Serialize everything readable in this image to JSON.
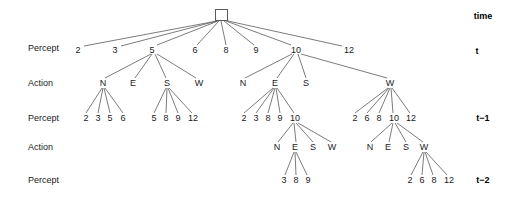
{
  "figure": {
    "background": "#ffffff",
    "line_color": "#5a5a5a",
    "text_color": "#1a1a1a"
  },
  "row_labels": [
    {
      "id": "row-percept-t",
      "text": "Percept",
      "x": 28,
      "y": 48
    },
    {
      "id": "row-action-t",
      "text": "Action",
      "x": 28,
      "y": 83
    },
    {
      "id": "row-percept-t1",
      "text": "Percept",
      "x": 28,
      "y": 118
    },
    {
      "id": "row-action-t1",
      "text": "Action",
      "x": 28,
      "y": 147
    },
    {
      "id": "row-percept-t2",
      "text": "Percept",
      "x": 28,
      "y": 180
    }
  ],
  "time_labels": [
    {
      "id": "time-header",
      "text": "time",
      "x": 483,
      "y": 16
    },
    {
      "id": "time-t",
      "text": "t",
      "x": 477,
      "y": 51
    },
    {
      "id": "time-t-minus-1",
      "text": "t−1",
      "x": 483,
      "y": 118
    },
    {
      "id": "time-t-minus-2",
      "text": "t−2",
      "x": 483,
      "y": 180
    }
  ],
  "root": {
    "id": "root-node",
    "x": 215,
    "y": 9,
    "w": 13,
    "h": 12
  },
  "nodes": [
    {
      "id": "p-t-2",
      "text": "2",
      "x": 78,
      "y": 50,
      "level": "percept-t"
    },
    {
      "id": "p-t-3",
      "text": "3",
      "x": 115,
      "y": 50,
      "level": "percept-t"
    },
    {
      "id": "p-t-5",
      "text": "5",
      "x": 152,
      "y": 50,
      "level": "percept-t"
    },
    {
      "id": "p-t-6",
      "text": "6",
      "x": 195,
      "y": 50,
      "level": "percept-t"
    },
    {
      "id": "p-t-8",
      "text": "8",
      "x": 226,
      "y": 50,
      "level": "percept-t"
    },
    {
      "id": "p-t-9",
      "text": "9",
      "x": 256,
      "y": 50,
      "level": "percept-t"
    },
    {
      "id": "p-t-10",
      "text": "10",
      "x": 296,
      "y": 50,
      "level": "percept-t"
    },
    {
      "id": "p-t-12",
      "text": "12",
      "x": 349,
      "y": 50,
      "level": "percept-t"
    },
    {
      "id": "a-t-5-N",
      "text": "N",
      "x": 103,
      "y": 83,
      "level": "action-t"
    },
    {
      "id": "a-t-5-E",
      "text": "E",
      "x": 133,
      "y": 83,
      "level": "action-t"
    },
    {
      "id": "a-t-5-S",
      "text": "S",
      "x": 167,
      "y": 83,
      "level": "action-t"
    },
    {
      "id": "a-t-5-W",
      "text": "W",
      "x": 199,
      "y": 83,
      "level": "action-t"
    },
    {
      "id": "a-t-10-N",
      "text": "N",
      "x": 243,
      "y": 83,
      "level": "action-t"
    },
    {
      "id": "a-t-10-E",
      "text": "E",
      "x": 275,
      "y": 83,
      "level": "action-t"
    },
    {
      "id": "a-t-10-S",
      "text": "S",
      "x": 306,
      "y": 83,
      "level": "action-t"
    },
    {
      "id": "a-t-12-W",
      "text": "W",
      "x": 390,
      "y": 83,
      "level": "action-t"
    },
    {
      "id": "p-t1-g1-2",
      "text": "2",
      "x": 86,
      "y": 118,
      "level": "percept-t1"
    },
    {
      "id": "p-t1-g1-3",
      "text": "3",
      "x": 98,
      "y": 118,
      "level": "percept-t1"
    },
    {
      "id": "p-t1-g1-5",
      "text": "5",
      "x": 110,
      "y": 118,
      "level": "percept-t1"
    },
    {
      "id": "p-t1-g1-6",
      "text": "6",
      "x": 123,
      "y": 118,
      "level": "percept-t1"
    },
    {
      "id": "p-t1-g2-5",
      "text": "5",
      "x": 154,
      "y": 118,
      "level": "percept-t1"
    },
    {
      "id": "p-t1-g2-8",
      "text": "8",
      "x": 166,
      "y": 118,
      "level": "percept-t1"
    },
    {
      "id": "p-t1-g2-9",
      "text": "9",
      "x": 178,
      "y": 118,
      "level": "percept-t1"
    },
    {
      "id": "p-t1-g2-12",
      "text": "12",
      "x": 193,
      "y": 118,
      "level": "percept-t1"
    },
    {
      "id": "p-t1-g3-2",
      "text": "2",
      "x": 244,
      "y": 118,
      "level": "percept-t1"
    },
    {
      "id": "p-t1-g3-3",
      "text": "3",
      "x": 256,
      "y": 118,
      "level": "percept-t1"
    },
    {
      "id": "p-t1-g3-8",
      "text": "8",
      "x": 268,
      "y": 118,
      "level": "percept-t1"
    },
    {
      "id": "p-t1-g3-9",
      "text": "9",
      "x": 280,
      "y": 118,
      "level": "percept-t1"
    },
    {
      "id": "p-t1-g3-10",
      "text": "10",
      "x": 295,
      "y": 118,
      "level": "percept-t1"
    },
    {
      "id": "p-t1-g4-2",
      "text": "2",
      "x": 355,
      "y": 118,
      "level": "percept-t1"
    },
    {
      "id": "p-t1-g4-6",
      "text": "6",
      "x": 367,
      "y": 118,
      "level": "percept-t1"
    },
    {
      "id": "p-t1-g4-8",
      "text": "8",
      "x": 379,
      "y": 118,
      "level": "percept-t1"
    },
    {
      "id": "p-t1-g4-10",
      "text": "10",
      "x": 394,
      "y": 118,
      "level": "percept-t1"
    },
    {
      "id": "p-t1-g4-12",
      "text": "12",
      "x": 411,
      "y": 118,
      "level": "percept-t1"
    },
    {
      "id": "a-t1-g1-N",
      "text": "N",
      "x": 277,
      "y": 147,
      "level": "action-t1"
    },
    {
      "id": "a-t1-g1-E",
      "text": "E",
      "x": 295,
      "y": 147,
      "level": "action-t1"
    },
    {
      "id": "a-t1-g1-S",
      "text": "S",
      "x": 313,
      "y": 147,
      "level": "action-t1"
    },
    {
      "id": "a-t1-g1-W",
      "text": "W",
      "x": 332,
      "y": 147,
      "level": "action-t1"
    },
    {
      "id": "a-t1-g2-N",
      "text": "N",
      "x": 370,
      "y": 147,
      "level": "action-t1"
    },
    {
      "id": "a-t1-g2-E",
      "text": "E",
      "x": 388,
      "y": 147,
      "level": "action-t1"
    },
    {
      "id": "a-t1-g2-S",
      "text": "S",
      "x": 406,
      "y": 147,
      "level": "action-t1"
    },
    {
      "id": "a-t1-g2-W",
      "text": "W",
      "x": 424,
      "y": 147,
      "level": "action-t1"
    },
    {
      "id": "p-t2-g1-3",
      "text": "3",
      "x": 284,
      "y": 180,
      "level": "percept-t2"
    },
    {
      "id": "p-t2-g1-8",
      "text": "8",
      "x": 296,
      "y": 180,
      "level": "percept-t2"
    },
    {
      "id": "p-t2-g1-9",
      "text": "9",
      "x": 308,
      "y": 180,
      "level": "percept-t2"
    },
    {
      "id": "p-t2-g2-2",
      "text": "2",
      "x": 410,
      "y": 180,
      "level": "percept-t2"
    },
    {
      "id": "p-t2-g2-6",
      "text": "6",
      "x": 422,
      "y": 180,
      "level": "percept-t2"
    },
    {
      "id": "p-t2-g2-8",
      "text": "8",
      "x": 434,
      "y": 180,
      "level": "percept-t2"
    },
    {
      "id": "p-t2-g2-12",
      "text": "12",
      "x": 449,
      "y": 180,
      "level": "percept-t2"
    }
  ],
  "edges": [
    {
      "from": "root-node",
      "to": "p-t-2",
      "x1": 217,
      "y1": 21,
      "x2": 84,
      "y2": 46
    },
    {
      "from": "root-node",
      "to": "p-t-3",
      "x1": 217,
      "y1": 21,
      "x2": 121,
      "y2": 46
    },
    {
      "from": "root-node",
      "to": "p-t-5",
      "x1": 218,
      "y1": 21,
      "x2": 157,
      "y2": 45
    },
    {
      "from": "root-node",
      "to": "p-t-6",
      "x1": 219,
      "y1": 21,
      "x2": 197,
      "y2": 45
    },
    {
      "from": "root-node",
      "to": "p-t-8",
      "x1": 221,
      "y1": 21,
      "x2": 226,
      "y2": 45
    },
    {
      "from": "root-node",
      "to": "p-t-9",
      "x1": 224,
      "y1": 21,
      "x2": 254,
      "y2": 45
    },
    {
      "from": "root-node",
      "to": "p-t-10",
      "x1": 226,
      "y1": 21,
      "x2": 291,
      "y2": 45
    },
    {
      "from": "root-node",
      "to": "p-t-12",
      "x1": 228,
      "y1": 21,
      "x2": 342,
      "y2": 46
    },
    {
      "from": "p-t-5",
      "to": "a-t-5-N",
      "x1": 151,
      "y1": 54,
      "x2": 105,
      "y2": 78
    },
    {
      "from": "p-t-5",
      "to": "a-t-5-E",
      "x1": 152,
      "y1": 54,
      "x2": 135,
      "y2": 78
    },
    {
      "from": "p-t-5",
      "to": "a-t-5-S",
      "x1": 155,
      "y1": 54,
      "x2": 166,
      "y2": 78
    },
    {
      "from": "p-t-5",
      "to": "a-t-5-W",
      "x1": 157,
      "y1": 54,
      "x2": 196,
      "y2": 78
    },
    {
      "from": "p-t-10",
      "to": "a-t-10-N",
      "x1": 292,
      "y1": 54,
      "x2": 245,
      "y2": 78
    },
    {
      "from": "p-t-10",
      "to": "a-t-10-E",
      "x1": 294,
      "y1": 54,
      "x2": 277,
      "y2": 78
    },
    {
      "from": "p-t-10",
      "to": "a-t-10-S",
      "x1": 298,
      "y1": 54,
      "x2": 306,
      "y2": 78
    },
    {
      "from": "p-t-10",
      "to": "a-t-12-W",
      "x1": 301,
      "y1": 54,
      "x2": 387,
      "y2": 78
    },
    {
      "from": "a-t-5-N",
      "to": "p-t1-g1-2",
      "x1": 102,
      "y1": 88,
      "x2": 86,
      "y2": 113
    },
    {
      "from": "a-t-5-N",
      "to": "p-t1-g1-3",
      "x1": 103,
      "y1": 88,
      "x2": 98,
      "y2": 113
    },
    {
      "from": "a-t-5-N",
      "to": "p-t1-g1-5",
      "x1": 104,
      "y1": 88,
      "x2": 110,
      "y2": 113
    },
    {
      "from": "a-t-5-N",
      "to": "p-t1-g1-6",
      "x1": 105,
      "y1": 88,
      "x2": 123,
      "y2": 113
    },
    {
      "from": "a-t-5-S",
      "to": "p-t1-g2-5",
      "x1": 166,
      "y1": 88,
      "x2": 154,
      "y2": 113
    },
    {
      "from": "a-t-5-S",
      "to": "p-t1-g2-8",
      "x1": 167,
      "y1": 88,
      "x2": 166,
      "y2": 113
    },
    {
      "from": "a-t-5-S",
      "to": "p-t1-g2-9",
      "x1": 168,
      "y1": 88,
      "x2": 178,
      "y2": 113
    },
    {
      "from": "a-t-5-S",
      "to": "p-t1-g2-12",
      "x1": 169,
      "y1": 88,
      "x2": 192,
      "y2": 113
    },
    {
      "from": "a-t-10-E",
      "to": "p-t1-g3-2",
      "x1": 273,
      "y1": 88,
      "x2": 244,
      "y2": 113
    },
    {
      "from": "a-t-10-E",
      "to": "p-t1-g3-3",
      "x1": 274,
      "y1": 88,
      "x2": 256,
      "y2": 113
    },
    {
      "from": "a-t-10-E",
      "to": "p-t1-g3-8",
      "x1": 275,
      "y1": 88,
      "x2": 268,
      "y2": 113
    },
    {
      "from": "a-t-10-E",
      "to": "p-t1-g3-9",
      "x1": 276,
      "y1": 88,
      "x2": 280,
      "y2": 113
    },
    {
      "from": "a-t-10-E",
      "to": "p-t1-g3-10",
      "x1": 277,
      "y1": 88,
      "x2": 294,
      "y2": 113
    },
    {
      "from": "a-t-12-W",
      "to": "p-t1-g4-2",
      "x1": 388,
      "y1": 88,
      "x2": 355,
      "y2": 113
    },
    {
      "from": "a-t-12-W",
      "to": "p-t1-g4-6",
      "x1": 389,
      "y1": 88,
      "x2": 367,
      "y2": 113
    },
    {
      "from": "a-t-12-W",
      "to": "p-t1-g4-8",
      "x1": 390,
      "y1": 88,
      "x2": 379,
      "y2": 113
    },
    {
      "from": "a-t-12-W",
      "to": "p-t1-g4-10",
      "x1": 391,
      "y1": 88,
      "x2": 393,
      "y2": 113
    },
    {
      "from": "a-t-12-W",
      "to": "p-t1-g4-12",
      "x1": 392,
      "y1": 88,
      "x2": 410,
      "y2": 113
    },
    {
      "from": "p-t1-g3-10",
      "to": "a-t1-g1-N",
      "x1": 293,
      "y1": 123,
      "x2": 278,
      "y2": 142
    },
    {
      "from": "p-t1-g3-10",
      "to": "a-t1-g1-E",
      "x1": 294,
      "y1": 123,
      "x2": 296,
      "y2": 142
    },
    {
      "from": "p-t1-g3-10",
      "to": "a-t1-g1-S",
      "x1": 296,
      "y1": 123,
      "x2": 313,
      "y2": 142
    },
    {
      "from": "p-t1-g3-10",
      "to": "a-t1-g1-W",
      "x1": 298,
      "y1": 123,
      "x2": 331,
      "y2": 142
    },
    {
      "from": "p-t1-g4-10",
      "to": "a-t1-g2-N",
      "x1": 392,
      "y1": 123,
      "x2": 371,
      "y2": 142
    },
    {
      "from": "p-t1-g4-10",
      "to": "a-t1-g2-E",
      "x1": 393,
      "y1": 123,
      "x2": 389,
      "y2": 142
    },
    {
      "from": "p-t1-g4-10",
      "to": "a-t1-g2-S",
      "x1": 395,
      "y1": 123,
      "x2": 406,
      "y2": 142
    },
    {
      "from": "p-t1-g4-10",
      "to": "a-t1-g2-W",
      "x1": 397,
      "y1": 123,
      "x2": 423,
      "y2": 142
    },
    {
      "from": "a-t1-g1-E",
      "to": "p-t2-g1-3",
      "x1": 294,
      "y1": 152,
      "x2": 285,
      "y2": 175
    },
    {
      "from": "a-t1-g1-E",
      "to": "p-t2-g1-8",
      "x1": 295,
      "y1": 152,
      "x2": 296,
      "y2": 175
    },
    {
      "from": "a-t1-g1-E",
      "to": "p-t2-g1-9",
      "x1": 296,
      "y1": 152,
      "x2": 307,
      "y2": 175
    },
    {
      "from": "a-t1-g2-W",
      "to": "p-t2-g2-2",
      "x1": 423,
      "y1": 152,
      "x2": 411,
      "y2": 175
    },
    {
      "from": "a-t1-g2-W",
      "to": "p-t2-g2-6",
      "x1": 424,
      "y1": 152,
      "x2": 422,
      "y2": 175
    },
    {
      "from": "a-t1-g2-W",
      "to": "p-t2-g2-8",
      "x1": 425,
      "y1": 152,
      "x2": 433,
      "y2": 175
    },
    {
      "from": "a-t1-g2-W",
      "to": "p-t2-g2-12",
      "x1": 426,
      "y1": 152,
      "x2": 447,
      "y2": 175
    }
  ]
}
